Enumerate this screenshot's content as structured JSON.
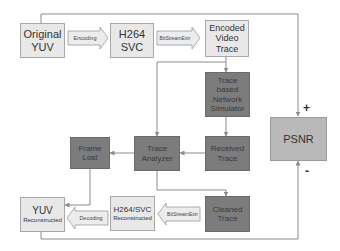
{
  "diagram": {
    "nodes": {
      "original_yuv": "Original\nYUV",
      "h264_svc": "H264\nSVC",
      "encoded_video_trace": "Encoded\nVideo\nTrace",
      "network_simulator": "Trace\nbased\nNetwork\nSimulator",
      "received_trace": "Received\nTrace",
      "trace_analyzer": "Trace\nAnalyzer",
      "frame_lost": "Frame\nLost",
      "psnr": "PSNR",
      "cleaned_trace": "Cleaned\nTrace",
      "h264_svc_reconstructed_title": "H264/SVC",
      "h264_svc_reconstructed_sub": "Reconstructed",
      "yuv_reconstructed_title": "YUV",
      "yuv_reconstructed_sub": "Reconstructed"
    },
    "arrow_labels": {
      "encoding": "Encoding",
      "bitstreamextr_top": "BitStreamExtr",
      "bitstreamextr_bottom": "BitStreamExtr",
      "decoding": "Decoding"
    },
    "signs": {
      "plus": "+",
      "minus": "-"
    },
    "colors": {
      "light": "#e8e8e8",
      "dark": "#7c7c7c",
      "psnr": "#b9b9b9",
      "line": "#8a8a8a"
    }
  }
}
